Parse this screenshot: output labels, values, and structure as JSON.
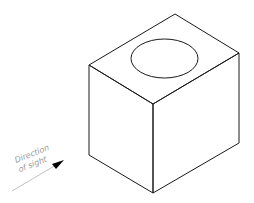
{
  "diagram": {
    "type": "isometric-block-with-circular-top-feature",
    "annotation": {
      "line1": "Direction",
      "line2": "of sight"
    },
    "colors": {
      "edges": "#1a1a1a",
      "annotation_text": "#9a9a9a",
      "arrow_line": "#b0b0b0",
      "arrow_head": "#000000",
      "background": "#ffffff"
    }
  }
}
